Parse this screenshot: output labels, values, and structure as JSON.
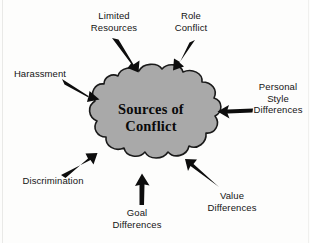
{
  "diagram": {
    "type": "cloud-hub-and-spoke",
    "center": {
      "shape": "cloud",
      "fill_color": "#a9a9a9",
      "stroke_color": "#1a1a1a",
      "title": "Sources of\nConflict"
    },
    "arrow_color": "#0d0d0d",
    "background_color": "#fdfdfc",
    "labels": [
      {
        "id": "limited-resources",
        "text": "Limited\nResources",
        "position": "top-left",
        "arrow_direction": "down-right"
      },
      {
        "id": "role-conflict",
        "text": "Role\nConflict",
        "position": "top-right",
        "arrow_direction": "down-left"
      },
      {
        "id": "harassment",
        "text": "Harassment",
        "position": "left-upper",
        "arrow_direction": "down-right"
      },
      {
        "id": "personal-style-differences",
        "text": "Personal\nStyle\nDifferences",
        "position": "right",
        "arrow_direction": "left"
      },
      {
        "id": "discrimination",
        "text": "Discrimination",
        "position": "left-lower",
        "arrow_direction": "up-right"
      },
      {
        "id": "goal-differences",
        "text": "Goal\nDifferences",
        "position": "bottom-center",
        "arrow_direction": "up"
      },
      {
        "id": "value-differences",
        "text": "Value\nDifferences",
        "position": "bottom-right",
        "arrow_direction": "up-left"
      }
    ]
  }
}
